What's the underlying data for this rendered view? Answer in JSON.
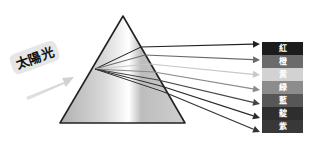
{
  "sunlight_label": "太陽光",
  "prism": {
    "apex": [
      123,
      16
    ],
    "base_left": [
      60,
      123
    ],
    "base_right": [
      185,
      123
    ],
    "entry_point": [
      95,
      69
    ]
  },
  "bands": [
    {
      "label": "紅",
      "color": "#1c1c1c"
    },
    {
      "label": "橙",
      "color": "#6b6b6b"
    },
    {
      "label": "黄",
      "color": "#d2d2d2"
    },
    {
      "label": "緑",
      "color": "#8c8c8c"
    },
    {
      "label": "藍",
      "color": "#575757"
    },
    {
      "label": "靛",
      "color": "#2e2e2e"
    },
    {
      "label": "紫",
      "color": "#383838"
    }
  ],
  "rays": [
    {
      "exit": [
        141,
        47
      ],
      "tip": [
        260,
        44
      ],
      "color": "#222222"
    },
    {
      "exit": [
        145,
        55
      ],
      "tip": [
        260,
        60
      ],
      "color": "#6a6a6a"
    },
    {
      "exit": [
        150,
        64
      ],
      "tip": [
        260,
        75
      ],
      "color": "#c8c8c8"
    },
    {
      "exit": [
        154,
        72
      ],
      "tip": [
        260,
        90
      ],
      "color": "#8a8a8a"
    },
    {
      "exit": [
        158,
        80
      ],
      "tip": [
        260,
        104
      ],
      "color": "#444444"
    },
    {
      "exit": [
        161,
        86
      ],
      "tip": [
        260,
        118
      ],
      "color": "#2a2a2a"
    },
    {
      "exit": [
        164,
        92
      ],
      "tip": [
        260,
        132
      ],
      "color": "#333333"
    }
  ]
}
